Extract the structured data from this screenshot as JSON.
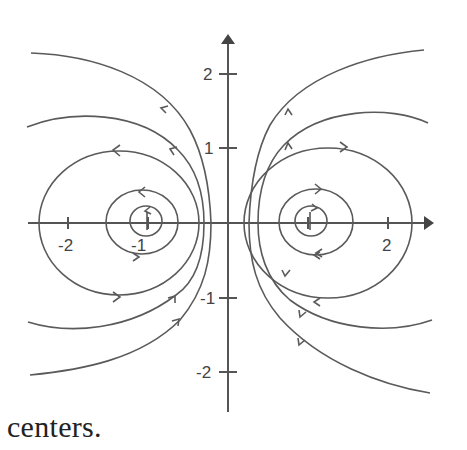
{
  "figure": {
    "title": "",
    "line_color": "#555555",
    "axes": {
      "x_ticks": [
        {
          "value": -2,
          "label": "-2"
        },
        {
          "value": -1,
          "label": "-1"
        },
        {
          "value": 1,
          "label": ""
        },
        {
          "value": 2,
          "label": "2"
        }
      ],
      "y_ticks": [
        {
          "value": 2,
          "label": "2"
        },
        {
          "value": 1,
          "label": "1"
        },
        {
          "value": -1,
          "label": "-1"
        },
        {
          "value": -2,
          "label": "-2"
        }
      ],
      "x_range": [
        -2.8,
        2.5
      ],
      "y_range": [
        -2.6,
        2.5
      ]
    },
    "centers": [
      {
        "x": -1,
        "y": 0,
        "orbit_direction": "clockwise"
      },
      {
        "x": 1,
        "y": 0,
        "orbit_direction": "counterclockwise"
      }
    ]
  },
  "caption": {
    "text": "centers."
  }
}
